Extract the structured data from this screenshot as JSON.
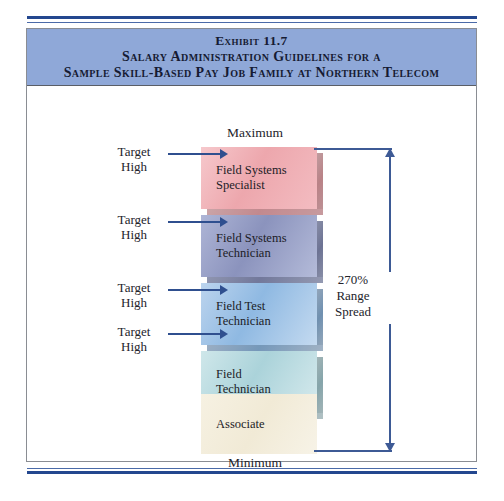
{
  "exhibit": {
    "title_line_1": "Exhibit 11.7",
    "title_line_2": "Salary Administration Guidelines for a",
    "title_line_3": "Sample Skill-Based Pay Job Family at Northern Telecom",
    "banner_color": "#8FA8D8",
    "rule_color": "#23478F"
  },
  "scale": {
    "maximum_label": "Maximum",
    "minimum_label": "Minimum"
  },
  "bands": [
    {
      "label_line_1": "Field Systems",
      "label_line_2": "Specialist",
      "color": "#EDA7AD"
    },
    {
      "label_line_1": "Field Systems",
      "label_line_2": "Technician",
      "color": "#8B93BD"
    },
    {
      "label_line_1": "Field Test",
      "label_line_2": "Technician",
      "color": "#8FB9E2"
    },
    {
      "label_line_1": "Field",
      "label_line_2": "Technician",
      "color": "#ABD3DA"
    },
    {
      "label_line_1": "Associate",
      "label_line_2": "",
      "color": "#F1EAD6"
    }
  ],
  "callouts": [
    {
      "line_1": "Target",
      "line_2": "High"
    },
    {
      "line_1": "Target",
      "line_2": "High"
    },
    {
      "line_1": "Target",
      "line_2": "High"
    },
    {
      "line_1": "Target",
      "line_2": "High"
    }
  ],
  "range_spread": {
    "value": "270%",
    "line_2": "Range",
    "line_3": "Spread",
    "arrow_color": "#3D5A95"
  }
}
